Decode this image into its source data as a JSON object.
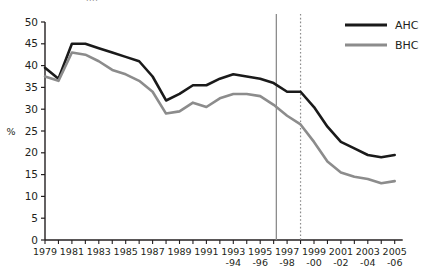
{
  "clipped_header": "....",
  "chart_data": {
    "type": "line",
    "title": "",
    "xlabel": "",
    "ylabel": "%",
    "ylim": [
      0,
      50
    ],
    "ytick_step": 5,
    "yticks": [
      0,
      5,
      10,
      15,
      20,
      25,
      30,
      35,
      40,
      45,
      50
    ],
    "grid": false,
    "legend_position": "top-right",
    "categories": [
      "1979",
      "1980",
      "1981",
      "1982",
      "1983",
      "1984",
      "1985",
      "1986",
      "1987",
      "1988",
      "1989",
      "1990",
      "1991",
      "1992",
      "1993-94",
      "1994-95",
      "1995-96",
      "1996-97",
      "1997-98",
      "1998-99",
      "1999-00",
      "2000-01",
      "2001-02",
      "2002-03",
      "2003-04",
      "2004-05",
      "2005-06"
    ],
    "xtick_labels": [
      {
        "index": 0,
        "line1": "1979",
        "line2": ""
      },
      {
        "index": 2,
        "line1": "1981",
        "line2": ""
      },
      {
        "index": 4,
        "line1": "1983",
        "line2": ""
      },
      {
        "index": 6,
        "line1": "1985",
        "line2": ""
      },
      {
        "index": 8,
        "line1": "1987",
        "line2": ""
      },
      {
        "index": 10,
        "line1": "1989",
        "line2": ""
      },
      {
        "index": 12,
        "line1": "1991",
        "line2": ""
      },
      {
        "index": 14,
        "line1": "1993",
        "line2": "-94"
      },
      {
        "index": 16,
        "line1": "1995",
        "line2": "-96"
      },
      {
        "index": 18,
        "line1": "1997",
        "line2": "-98"
      },
      {
        "index": 20,
        "line1": "1999",
        "line2": "-00"
      },
      {
        "index": 22,
        "line1": "2001",
        "line2": "-02"
      },
      {
        "index": 24,
        "line1": "2003",
        "line2": "-04"
      },
      {
        "index": 26,
        "line1": "2005",
        "line2": "-06"
      }
    ],
    "series": [
      {
        "name": "AHC",
        "color": "#1a1a1a",
        "values": [
          39.5,
          37.0,
          45.0,
          45.0,
          44.0,
          43.0,
          42.0,
          41.0,
          37.5,
          32.0,
          33.5,
          35.5,
          35.5,
          37.0,
          38.0,
          37.5,
          37.0,
          36.0,
          34.0,
          34.0,
          30.5,
          26.0,
          22.5,
          21.0,
          19.5,
          19.0,
          19.5
        ]
      },
      {
        "name": "BHC",
        "color": "#8c8c8c",
        "values": [
          37.5,
          36.5,
          43.0,
          42.5,
          41.0,
          39.0,
          38.0,
          36.5,
          34.0,
          29.0,
          29.5,
          31.5,
          30.5,
          32.5,
          33.5,
          33.5,
          33.0,
          31.0,
          28.5,
          26.5,
          22.5,
          18.0,
          15.5,
          14.5,
          14.0,
          13.0,
          13.5
        ]
      }
    ],
    "reference_lines": [
      {
        "name": "solid-marker",
        "at_index": 17.2,
        "style": "solid",
        "color": "#8c8c8c"
      },
      {
        "name": "dotted-marker",
        "at_index": 19.0,
        "style": "dotted",
        "color": "#8c8c8c"
      }
    ],
    "legend": [
      {
        "label": "AHC",
        "color": "#1a1a1a"
      },
      {
        "label": "BHC",
        "color": "#8c8c8c"
      }
    ]
  }
}
